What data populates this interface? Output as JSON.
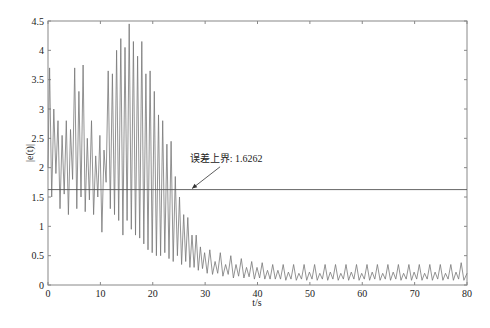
{
  "chart_data": {
    "type": "line",
    "title": "",
    "xlabel": "t/s",
    "ylabel": "|e(t)|",
    "xlim": [
      0,
      80
    ],
    "ylim": [
      0,
      4.5
    ],
    "xticks": [
      0,
      10,
      20,
      30,
      40,
      50,
      60,
      70,
      80
    ],
    "yticks": [
      0,
      0.5,
      1,
      1.5,
      2,
      2.5,
      3,
      3.5,
      4,
      4.5
    ],
    "grid": false,
    "legend": null,
    "series": [
      {
        "name": "|e(t)|",
        "color": "#777777",
        "x": [
          0,
          0.3,
          0.7,
          1.1,
          1.5,
          1.9,
          2.3,
          2.7,
          3.1,
          3.5,
          3.9,
          4.3,
          4.7,
          5.1,
          5.5,
          5.9,
          6.3,
          6.7,
          7.1,
          7.5,
          7.9,
          8.3,
          8.7,
          9.1,
          9.5,
          9.9,
          10.3,
          10.7,
          11.1,
          11.5,
          11.9,
          12.3,
          12.7,
          13.1,
          13.5,
          13.9,
          14.3,
          14.7,
          15.1,
          15.5,
          15.9,
          16.3,
          16.7,
          17.1,
          17.5,
          17.9,
          18.3,
          18.7,
          19.1,
          19.5,
          19.9,
          20.3,
          20.7,
          21.1,
          21.5,
          21.9,
          22.3,
          22.7,
          23.1,
          23.5,
          23.9,
          24.3,
          24.7,
          25.1,
          25.5,
          25.9,
          26.3,
          26.7,
          27.1,
          27.5,
          27.9,
          28.3,
          28.7,
          29.1,
          29.5,
          29.9,
          30.4,
          30.9,
          31.4,
          31.9,
          32.4,
          32.9,
          33.4,
          33.9,
          34.4,
          34.9,
          35.4,
          35.9,
          36.4,
          36.9,
          37.4,
          37.9,
          38.4,
          38.9,
          39.4,
          39.9,
          40.4,
          40.9,
          41.4,
          41.9,
          42.4,
          42.9,
          43.4,
          43.9,
          44.4,
          44.9,
          45.4,
          45.9,
          46.4,
          46.9,
          47.4,
          47.9,
          48.4,
          48.9,
          49.4,
          49.9,
          50.4,
          50.9,
          51.4,
          51.9,
          52.4,
          52.9,
          53.4,
          53.9,
          54.4,
          54.9,
          55.4,
          55.9,
          56.4,
          56.9,
          57.4,
          57.9,
          58.4,
          58.9,
          59.4,
          59.9,
          60.4,
          60.9,
          61.4,
          61.9,
          62.4,
          62.9,
          63.4,
          63.9,
          64.4,
          64.9,
          65.4,
          65.9,
          66.4,
          66.9,
          67.4,
          67.9,
          68.4,
          68.9,
          69.4,
          69.9,
          70.4,
          70.9,
          71.4,
          71.9,
          72.4,
          72.9,
          73.4,
          73.9,
          74.4,
          74.9,
          75.4,
          75.9,
          76.4,
          76.9,
          77.4,
          77.9,
          78.4,
          78.9,
          79.4,
          80
        ],
        "y": [
          2.0,
          3.7,
          1.5,
          3.0,
          1.9,
          2.8,
          1.3,
          2.55,
          1.55,
          2.8,
          1.2,
          2.65,
          1.8,
          3.7,
          1.3,
          3.3,
          1.5,
          3.75,
          1.25,
          2.5,
          1.45,
          2.8,
          1.2,
          2.2,
          1.5,
          2.55,
          0.9,
          2.3,
          1.75,
          3.65,
          1.3,
          3.6,
          1.2,
          4.0,
          1.1,
          4.2,
          0.85,
          4.05,
          1.1,
          4.45,
          0.95,
          4.15,
          0.85,
          3.9,
          0.8,
          4.15,
          0.7,
          3.6,
          0.6,
          3.65,
          0.55,
          3.3,
          0.5,
          2.9,
          0.5,
          2.8,
          0.55,
          2.4,
          0.45,
          2.45,
          0.4,
          1.85,
          0.5,
          1.5,
          0.35,
          1.2,
          0.4,
          1.15,
          0.3,
          0.85,
          0.3,
          0.85,
          0.25,
          0.65,
          0.28,
          0.55,
          0.2,
          0.6,
          0.18,
          0.4,
          0.2,
          0.55,
          0.15,
          0.35,
          0.18,
          0.5,
          0.12,
          0.35,
          0.15,
          0.45,
          0.12,
          0.3,
          0.14,
          0.4,
          0.1,
          0.3,
          0.12,
          0.38,
          0.1,
          0.25,
          0.1,
          0.35,
          0.1,
          0.25,
          0.1,
          0.35,
          0.08,
          0.22,
          0.1,
          0.35,
          0.08,
          0.2,
          0.1,
          0.35,
          0.08,
          0.22,
          0.1,
          0.35,
          0.08,
          0.2,
          0.1,
          0.35,
          0.08,
          0.22,
          0.1,
          0.35,
          0.08,
          0.2,
          0.1,
          0.35,
          0.08,
          0.22,
          0.1,
          0.35,
          0.08,
          0.2,
          0.1,
          0.35,
          0.08,
          0.22,
          0.1,
          0.35,
          0.08,
          0.2,
          0.1,
          0.35,
          0.08,
          0.22,
          0.1,
          0.35,
          0.08,
          0.2,
          0.1,
          0.35,
          0.08,
          0.22,
          0.1,
          0.35,
          0.08,
          0.2,
          0.1,
          0.35,
          0.08,
          0.22,
          0.1,
          0.35,
          0.08,
          0.2,
          0.1,
          0.35,
          0.08,
          0.22,
          0.1,
          0.38,
          0.08,
          0.2
        ]
      },
      {
        "name": "error upper bound",
        "color": "#555555",
        "x": [
          0,
          80
        ],
        "y": [
          1.6262,
          1.6262
        ]
      }
    ],
    "annotations": [
      {
        "text": "误差上界: 1.6262",
        "text_x": 34,
        "text_y": 2.1,
        "arrow_to_x": 27.5,
        "arrow_to_y": 1.6262
      }
    ]
  },
  "labels": {
    "xlabel": "t/s",
    "ylabel": "|e(t)|",
    "annotation": "误差上界: 1.6262"
  }
}
